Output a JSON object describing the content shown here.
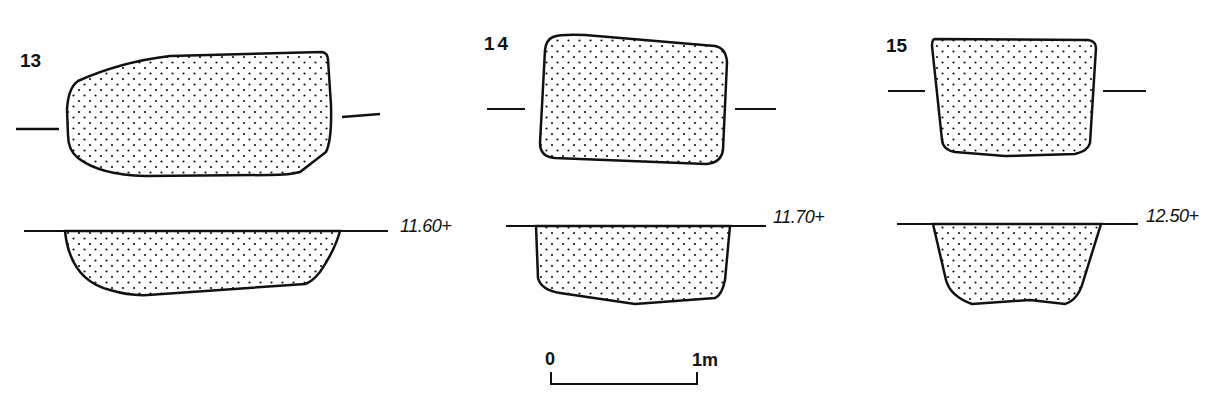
{
  "figure": {
    "features": [
      {
        "id": "13",
        "label": "13",
        "elevation": "11.60+"
      },
      {
        "id": "14",
        "label": "14",
        "elevation": "11.70+"
      },
      {
        "id": "15",
        "label": "15",
        "elevation": "12.50+"
      }
    ],
    "scale_bar": {
      "start_label": "0",
      "end_label": "1m"
    }
  }
}
